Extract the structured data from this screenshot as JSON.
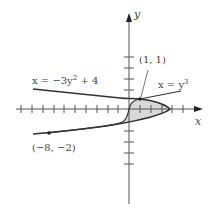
{
  "diagram": {
    "axes": {
      "x_label": "x",
      "y_label": "y"
    },
    "curves": [
      {
        "name": "parabola",
        "equation": "x = −3y² + 4",
        "eq_lhs": "x = −3y",
        "eq_exp": "2",
        "eq_rhs": " + 4"
      },
      {
        "name": "cubic",
        "equation": "x = y³",
        "eq_lhs": "x = y",
        "eq_exp": "3"
      }
    ],
    "points": [
      {
        "label": "(1, 1)",
        "x": 1,
        "y": 1
      },
      {
        "label": "(−8, −2)",
        "x": -8,
        "y": -2
      }
    ],
    "shaded_region": "area between x = y³ and x = −3y² + 4 from y = −2 to y = 1",
    "colors": {
      "curve": "#333333",
      "axis": "#555555",
      "shade": "#d8d8d8",
      "text": "#444444"
    }
  }
}
